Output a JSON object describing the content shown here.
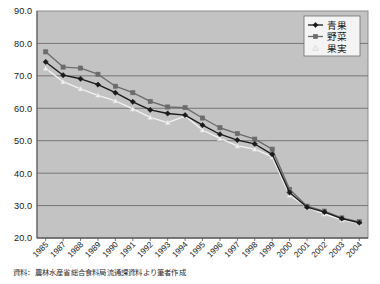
{
  "chart_data": {
    "type": "line",
    "title": "",
    "xlabel": "",
    "ylabel": "",
    "ylim": [
      20.0,
      90.0
    ],
    "ytick_step": 10.0,
    "ytick_labels": [
      "90.0",
      "80.0",
      "70.0",
      "60.0",
      "50.0",
      "40.0",
      "30.0",
      "20.0"
    ],
    "yticks": [
      90.0,
      80.0,
      70.0,
      60.0,
      50.0,
      40.0,
      30.0,
      20.0
    ],
    "grid": "horizontal",
    "legend_position": "top-right",
    "categories": [
      "1985",
      "1987",
      "1988",
      "1989",
      "1990",
      "1991",
      "1992",
      "1993",
      "1994",
      "1995",
      "1996",
      "1997",
      "1998",
      "1999",
      "2000",
      "2001",
      "2002",
      "2003",
      "2004"
    ],
    "series": [
      {
        "name": "青果",
        "marker": "diamond",
        "color": "#1a1a1a",
        "values": [
          74.3,
          70.2,
          69.1,
          67.3,
          64.8,
          62.0,
          59.5,
          58.4,
          57.9,
          54.8,
          52.0,
          50.2,
          49.0,
          45.8,
          34.0,
          29.5,
          28.0,
          26.0,
          24.7
        ]
      },
      {
        "name": "野菜",
        "marker": "square",
        "color": "#6b6b6b",
        "values": [
          77.4,
          72.7,
          72.4,
          70.5,
          66.8,
          64.8,
          62.1,
          60.4,
          60.2,
          57.0,
          54.0,
          52.2,
          50.5,
          47.4,
          35.0,
          29.8,
          28.3,
          26.2,
          25.0
        ]
      },
      {
        "name": "果実",
        "marker": "triangle",
        "color": "#f2f2f2",
        "values": [
          72.3,
          68.2,
          66.0,
          64.0,
          62.3,
          59.8,
          57.2,
          55.6,
          57.6,
          53.3,
          50.7,
          48.4,
          47.4,
          45.0,
          33.2,
          29.5,
          27.4,
          25.6,
          24.5
        ]
      }
    ]
  },
  "legend": {
    "items": [
      {
        "label": "青果"
      },
      {
        "label": "野菜"
      },
      {
        "label": "果実"
      }
    ]
  },
  "source_note": "資料：農林水産省総合食料局流通課資料より筆者作成",
  "colors": {
    "plot_background": "#c3c3c3",
    "page_background": "#ffffff",
    "gridline": "#6e6e6e",
    "axis": "#555555",
    "series_aoka": "#1a1a1a",
    "series_yasai": "#6b6b6b",
    "series_kajitsu": "#f2f2f2"
  }
}
